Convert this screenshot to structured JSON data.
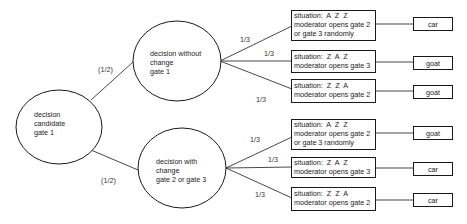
{
  "diagram": {
    "type": "decision-tree",
    "root": {
      "lines": [
        "decision",
        "candidate",
        "gate 1"
      ]
    },
    "branches": [
      {
        "probability": "(1/2)",
        "node": {
          "lines": [
            "decision without",
            "change",
            "gate 1"
          ]
        },
        "outcomes": [
          {
            "probability": "1/3",
            "situation": [
              "situation:  A  Z  Z",
              "moderator opens gate 2",
              "or gate 3 randomly"
            ],
            "result": "car"
          },
          {
            "probability": "1/3",
            "situation": [
              "situation:  Z  A  Z",
              "moderator opens gate 3"
            ],
            "result": "goat"
          },
          {
            "probability": "1/3",
            "situation": [
              "situation:  Z  Z  A",
              "moderator opens gate 2"
            ],
            "result": "goat"
          }
        ]
      },
      {
        "probability": "(1/2)",
        "node": {
          "lines": [
            "decision with",
            "change",
            "gate 2 or gate 3"
          ]
        },
        "outcomes": [
          {
            "probability": "1/3",
            "situation": [
              "situation:  A  Z  Z",
              "moderator opens gate 2",
              "or gate 3 randomly"
            ],
            "result": "goat"
          },
          {
            "probability": "1/3",
            "situation": [
              "situation:  Z  A  Z",
              "moderator opens gate 3"
            ],
            "result": "car"
          },
          {
            "probability": "1/3",
            "situation": [
              "situation:  Z  Z  A",
              "moderator opens gate 2"
            ],
            "result": "car"
          }
        ]
      }
    ]
  },
  "colors": {
    "stroke": "#1a1a1a",
    "text": "#222222",
    "background": "#ffffff"
  }
}
